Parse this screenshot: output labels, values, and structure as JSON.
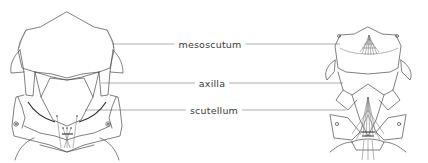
{
  "figure": {
    "left_specimen": "dorsal thorax outline (left view)",
    "right_specimen": "dorsal thorax outline with setae (right view)"
  },
  "labels": [
    {
      "id": "mesoscutum",
      "text": "mesoscutum",
      "x": 210,
      "y": 44
    },
    {
      "id": "axilla",
      "text": "axilla",
      "x": 210,
      "y": 83
    },
    {
      "id": "scutellum",
      "text": "scutellum",
      "x": 210,
      "y": 110
    }
  ],
  "colors": {
    "line": "#4a4a4a",
    "leader": "#8a8a8a",
    "text": "#3a3a3a",
    "background": "#ffffff"
  }
}
